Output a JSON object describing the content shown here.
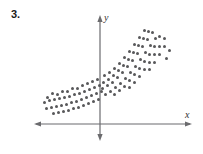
{
  "problem": {
    "number": "3."
  },
  "axes": {
    "x_label": "x",
    "y_label": "y",
    "origin_x": 100,
    "origin_y": 124,
    "x_axis_left": 34,
    "x_axis_right": 192,
    "y_axis_top": 16,
    "y_axis_bottom": 140,
    "axis_color": "#6b6b6e",
    "arrows": [
      "left",
      "right",
      "up",
      "down"
    ],
    "gridlines": false,
    "tick_labels": []
  },
  "chart_data": {
    "type": "scatter",
    "title": "",
    "xlabel": "x",
    "ylabel": "y",
    "grid": false,
    "legend": null,
    "marker_color": "#58585a",
    "marker_size_px": 3,
    "xlim": [
      -66,
      92
    ],
    "ylim": [
      -16,
      108
    ],
    "points": [
      [
        -53,
        27
      ],
      [
        -48,
        31
      ],
      [
        -43,
        30
      ],
      [
        -38,
        33
      ],
      [
        -33,
        33
      ],
      [
        -28,
        36
      ],
      [
        -23,
        36
      ],
      [
        -18,
        39
      ],
      [
        -13,
        41
      ],
      [
        -8,
        43
      ],
      [
        -3,
        45
      ],
      [
        -56,
        22
      ],
      [
        -51,
        24
      ],
      [
        -46,
        25
      ],
      [
        -41,
        26
      ],
      [
        -36,
        27
      ],
      [
        -31,
        28
      ],
      [
        -26,
        30
      ],
      [
        -21,
        31
      ],
      [
        -16,
        33
      ],
      [
        -11,
        35
      ],
      [
        -6,
        37
      ],
      [
        -1,
        39
      ],
      [
        -54,
        16
      ],
      [
        -49,
        17
      ],
      [
        -44,
        18
      ],
      [
        -39,
        19
      ],
      [
        -34,
        20
      ],
      [
        -29,
        22
      ],
      [
        -24,
        23
      ],
      [
        -19,
        25
      ],
      [
        -14,
        27
      ],
      [
        -9,
        29
      ],
      [
        -4,
        31
      ],
      [
        1,
        33
      ],
      [
        -47,
        11
      ],
      [
        -42,
        12
      ],
      [
        -37,
        13
      ],
      [
        -32,
        14
      ],
      [
        -27,
        16
      ],
      [
        -22,
        17
      ],
      [
        -17,
        19
      ],
      [
        -12,
        21
      ],
      [
        -7,
        23
      ],
      [
        -2,
        25
      ],
      [
        4,
        49
      ],
      [
        9,
        52
      ],
      [
        14,
        56
      ],
      [
        19,
        61
      ],
      [
        24,
        67
      ],
      [
        29,
        73
      ],
      [
        34,
        80
      ],
      [
        39,
        87
      ],
      [
        44,
        94
      ],
      [
        3,
        42
      ],
      [
        8,
        45
      ],
      [
        13,
        49
      ],
      [
        18,
        54
      ],
      [
        23,
        59
      ],
      [
        28,
        65
      ],
      [
        33,
        72
      ],
      [
        38,
        79
      ],
      [
        43,
        86
      ],
      [
        48,
        93
      ],
      [
        2,
        36
      ],
      [
        7,
        39
      ],
      [
        12,
        42
      ],
      [
        17,
        47
      ],
      [
        22,
        52
      ],
      [
        27,
        58
      ],
      [
        32,
        64
      ],
      [
        37,
        71
      ],
      [
        42,
        78
      ],
      [
        47,
        85
      ],
      [
        52,
        92
      ],
      [
        5,
        30
      ],
      [
        10,
        33
      ],
      [
        15,
        37
      ],
      [
        20,
        41
      ],
      [
        25,
        46
      ],
      [
        30,
        52
      ],
      [
        35,
        58
      ],
      [
        40,
        65
      ],
      [
        45,
        72
      ],
      [
        50,
        79
      ],
      [
        55,
        86
      ],
      [
        14,
        30
      ],
      [
        19,
        34
      ],
      [
        24,
        38
      ],
      [
        29,
        44
      ],
      [
        34,
        50
      ],
      [
        39,
        56
      ],
      [
        44,
        63
      ],
      [
        49,
        70
      ],
      [
        54,
        78
      ],
      [
        29,
        37
      ],
      [
        34,
        42
      ],
      [
        39,
        48
      ],
      [
        44,
        55
      ],
      [
        49,
        62
      ],
      [
        54,
        70
      ],
      [
        59,
        78
      ],
      [
        49,
        55
      ],
      [
        54,
        62
      ],
      [
        59,
        70
      ],
      [
        64,
        78
      ],
      [
        64,
        86
      ],
      [
        59,
        88
      ],
      [
        69,
        74
      ],
      [
        66,
        66
      ]
    ]
  }
}
